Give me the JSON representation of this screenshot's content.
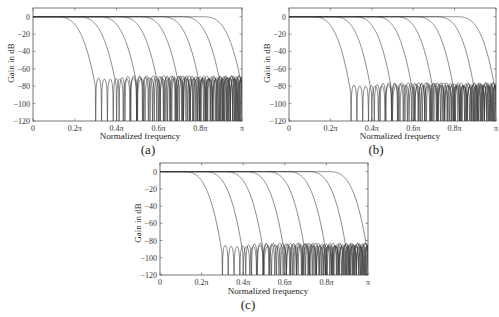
{
  "chart_data": [
    {
      "type": "line",
      "panel": "(a)",
      "title": "",
      "xlabel": "Normalized frequency",
      "ylabel": "Gain in dB",
      "xlim": [
        0,
        1
      ],
      "ylim": [
        -120,
        10
      ],
      "xticks": [
        "0",
        "0.2π",
        "0.4π",
        "0.6π",
        "0.8π",
        "π"
      ],
      "yticks": [
        "0",
        "-20",
        "-40",
        "-60",
        "-80",
        "-100",
        "-120"
      ],
      "grid": false,
      "series_description": "8 lowpass filter magnitude responses, 0 dB passband, stopband ripple peaks ≈ -70 dB",
      "series": [
        {
          "name": "filter1",
          "passband_edge": 0.15,
          "stopband_edge": 0.3,
          "stopband_peak_db": -70
        },
        {
          "name": "filter2",
          "passband_edge": 0.25,
          "stopband_edge": 0.4,
          "stopband_peak_db": -70
        },
        {
          "name": "filter3",
          "passband_edge": 0.35,
          "stopband_edge": 0.5,
          "stopband_peak_db": -70
        },
        {
          "name": "filter4",
          "passband_edge": 0.45,
          "stopband_edge": 0.6,
          "stopband_peak_db": -70
        },
        {
          "name": "filter5",
          "passband_edge": 0.55,
          "stopband_edge": 0.7,
          "stopband_peak_db": -70
        },
        {
          "name": "filter6",
          "passband_edge": 0.65,
          "stopband_edge": 0.8,
          "stopband_peak_db": -70
        },
        {
          "name": "filter7",
          "passband_edge": 0.75,
          "stopband_edge": 0.9,
          "stopband_peak_db": -70
        },
        {
          "name": "filter8",
          "passband_edge": 0.85,
          "stopband_edge": 1.0,
          "stopband_peak_db": -70
        }
      ]
    },
    {
      "type": "line",
      "panel": "(b)",
      "title": "",
      "xlabel": "Normalized frequency",
      "ylabel": "Gain in dB",
      "xlim": [
        0,
        1
      ],
      "ylim": [
        -120,
        10
      ],
      "xticks": [
        "0",
        "0.2π",
        "0.4π",
        "0.6π",
        "0.8π",
        "π"
      ],
      "yticks": [
        "0",
        "-20",
        "-40",
        "-60",
        "-80",
        "-100",
        "-120"
      ],
      "grid": false,
      "series_description": "8 lowpass filter magnitude responses, 0 dB passband, stopband ripple peaks ≈ -78 dB",
      "series": [
        {
          "name": "filter1",
          "passband_edge": 0.15,
          "stopband_edge": 0.3,
          "stopband_peak_db": -78
        },
        {
          "name": "filter2",
          "passband_edge": 0.25,
          "stopband_edge": 0.4,
          "stopband_peak_db": -78
        },
        {
          "name": "filter3",
          "passband_edge": 0.35,
          "stopband_edge": 0.5,
          "stopband_peak_db": -78
        },
        {
          "name": "filter4",
          "passband_edge": 0.45,
          "stopband_edge": 0.6,
          "stopband_peak_db": -78
        },
        {
          "name": "filter5",
          "passband_edge": 0.55,
          "stopband_edge": 0.7,
          "stopband_peak_db": -78
        },
        {
          "name": "filter6",
          "passband_edge": 0.65,
          "stopband_edge": 0.8,
          "stopband_peak_db": -78
        },
        {
          "name": "filter7",
          "passband_edge": 0.75,
          "stopband_edge": 0.9,
          "stopband_peak_db": -78
        },
        {
          "name": "filter8",
          "passband_edge": 0.85,
          "stopband_edge": 1.0,
          "stopband_peak_db": -78
        }
      ]
    },
    {
      "type": "line",
      "panel": "(c)",
      "title": "",
      "xlabel": "Normalized frequency",
      "ylabel": "Gain in dB",
      "xlim": [
        0,
        1
      ],
      "ylim": [
        -120,
        10
      ],
      "xticks": [
        "0",
        "0.2π",
        "0.4π",
        "0.6π",
        "0.8π",
        "π"
      ],
      "yticks": [
        "0",
        "-20",
        "-40",
        "-60",
        "-80",
        "-100",
        "-120"
      ],
      "grid": false,
      "series_description": "8 lowpass filter magnitude responses, 0 dB passband, stopband ripple peaks ≈ -85 dB",
      "series": [
        {
          "name": "filter1",
          "passband_edge": 0.15,
          "stopband_edge": 0.3,
          "stopband_peak_db": -85
        },
        {
          "name": "filter2",
          "passband_edge": 0.25,
          "stopband_edge": 0.4,
          "stopband_peak_db": -85
        },
        {
          "name": "filter3",
          "passband_edge": 0.35,
          "stopband_edge": 0.5,
          "stopband_peak_db": -85
        },
        {
          "name": "filter4",
          "passband_edge": 0.45,
          "stopband_edge": 0.6,
          "stopband_peak_db": -85
        },
        {
          "name": "filter5",
          "passband_edge": 0.55,
          "stopband_edge": 0.7,
          "stopband_peak_db": -85
        },
        {
          "name": "filter6",
          "passband_edge": 0.65,
          "stopband_edge": 0.8,
          "stopband_peak_db": -85
        },
        {
          "name": "filter7",
          "passband_edge": 0.75,
          "stopband_edge": 0.9,
          "stopband_peak_db": -85
        },
        {
          "name": "filter8",
          "passband_edge": 0.85,
          "stopband_edge": 1.0,
          "stopband_peak_db": -85
        }
      ]
    }
  ],
  "panels": {
    "a": {
      "caption": "(a)",
      "xlabel": "Normalized frequency",
      "ylabel": "Gain in dB"
    },
    "b": {
      "caption": "(b)",
      "xlabel": "Normalized frequency",
      "ylabel": "Gain in dB"
    },
    "c": {
      "caption": "(c)",
      "xlabel": "Normalized frequency",
      "ylabel": "Gain in dB"
    }
  },
  "colors": {
    "line": "#3a3a3a",
    "axis": "#555555"
  }
}
